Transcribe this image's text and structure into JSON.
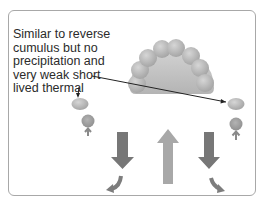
{
  "diagram": {
    "caption": {
      "lines": [
        "Similar to reverse",
        "cumulus but no",
        "precipitation and",
        "very weak short",
        "lived thermal"
      ]
    },
    "elements": [
      {
        "name": "central-cumulus-cloud",
        "description": "rounded cloud made of grey spheres"
      },
      {
        "name": "left-small-cloud",
        "description": "small grey ellipse with circle below and small up arrow"
      },
      {
        "name": "right-small-cloud",
        "description": "small grey ellipse with circle below and small up arrow"
      },
      {
        "name": "central-updraft-arrow",
        "direction": "up"
      },
      {
        "name": "left-downdraft-arrow",
        "direction": "down"
      },
      {
        "name": "right-downdraft-arrow",
        "direction": "down"
      },
      {
        "name": "left-curved-outflow-arrow",
        "direction": "down-left"
      },
      {
        "name": "right-curved-outflow-arrow",
        "direction": "down-right"
      }
    ],
    "colors": {
      "frame": "#a8a8a8",
      "cloud": "#bdbdbd",
      "cloud_dark": "#9a9a9a",
      "circle": "#a0a0a0",
      "updraft": "#a6a6a6",
      "downdraft": "#757575",
      "text": "#2b2b2b",
      "pointer": "#222222"
    }
  }
}
